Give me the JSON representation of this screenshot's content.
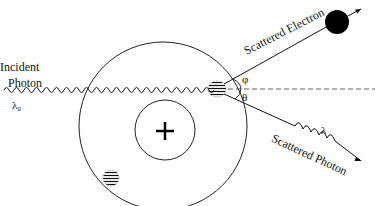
{
  "diagram": {
    "labels": {
      "incident": "Incident",
      "photon": "Photon",
      "lambda0": "λ₀",
      "scattered_electron": "Scattered Electron",
      "scattered_photon": "Scattered Photon",
      "lambda": "λ",
      "phi": "φ",
      "theta": "θ",
      "nucleus": "+"
    },
    "colors": {
      "line": "#111111",
      "electron": "#000000",
      "background": "#ffffff"
    }
  }
}
